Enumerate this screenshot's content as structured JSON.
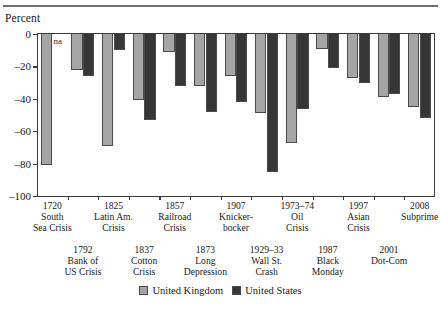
{
  "axis": {
    "y_title": "Percent",
    "y_ticks": [
      0,
      -20,
      -40,
      -60,
      -80,
      -100
    ],
    "y_tick_labels": [
      "0",
      "–20",
      "–40",
      "–60",
      "–80",
      "–100"
    ]
  },
  "legend": {
    "items": [
      {
        "label": "United Kingdom",
        "color": "#a5a5a5",
        "key": "uk"
      },
      {
        "label": "United States",
        "color": "#363636",
        "key": "us"
      }
    ]
  },
  "annotations": {
    "na_text": "na"
  },
  "chart_data": {
    "type": "bar",
    "title": "",
    "xlabel": "",
    "ylabel": "Percent",
    "ylim": [
      -100,
      0
    ],
    "grid": false,
    "legend_position": "bottom-center",
    "categories": [
      "1720 South Sea Crisis",
      "1792 Bank of US Crisis",
      "1825 Latin Am. Crisis",
      "1837 Cotton Crisis",
      "1857 Railroad Crisis",
      "1873 Long Depression",
      "1907 Knickerbocker",
      "1929–33 Wall St. Crash",
      "1973–74 Oil Crisis",
      "1987 Black Monday",
      "1997 Asian Crisis",
      "2001 Dot-Com",
      "2008 Subprime"
    ],
    "series": [
      {
        "name": "United Kingdom",
        "color": "#a5a5a5",
        "values": [
          -81,
          -22,
          -69,
          -41,
          -11,
          -32,
          -26,
          -49,
          -67,
          -9,
          -27,
          -39,
          -45
        ]
      },
      {
        "name": "United States",
        "color": "#363636",
        "values": [
          null,
          -26,
          -10,
          -53,
          -32,
          -48,
          -42,
          -85,
          -46,
          -21,
          -30,
          -37,
          -52
        ]
      }
    ],
    "labels_top_row": [
      {
        "lines": [
          "1720",
          "South",
          "Sea Crisis"
        ]
      },
      {
        "lines": [
          "1825",
          "Latin Am.",
          "Crisis"
        ]
      },
      {
        "lines": [
          "1857",
          "Railroad",
          "Crisis"
        ]
      },
      {
        "lines": [
          "1907",
          "Knicker-",
          "bocker"
        ]
      },
      {
        "lines": [
          "1973–74",
          "Oil",
          "Crisis"
        ]
      },
      {
        "lines": [
          "1997",
          "Asian",
          "Crisis"
        ]
      },
      {
        "lines": [
          "2008",
          "Subprime"
        ]
      }
    ],
    "labels_bottom_row": [
      {
        "lines": [
          "1792",
          "Bank of",
          "US Crisis"
        ]
      },
      {
        "lines": [
          "1837",
          "Cotton",
          "Crisis"
        ]
      },
      {
        "lines": [
          "1873",
          "Long",
          "Depression"
        ]
      },
      {
        "lines": [
          "1929–33",
          "Wall St.",
          "Crash"
        ]
      },
      {
        "lines": [
          "1987",
          "Black",
          "Monday"
        ]
      },
      {
        "lines": [
          "2001",
          "Dot-Com"
        ]
      }
    ]
  }
}
